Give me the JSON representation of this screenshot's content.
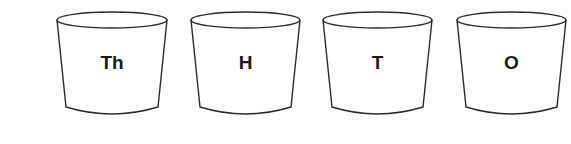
{
  "diagram": {
    "stroke_color": "#2a2a2a",
    "cups": [
      {
        "label": "Th",
        "meaning": "Thousands",
        "x_left": 57,
        "x_right": 167
      },
      {
        "label": "H",
        "meaning": "Hundreds",
        "x_left": 191,
        "x_right": 300
      },
      {
        "label": "T",
        "meaning": "Tens",
        "x_left": 323,
        "x_right": 432
      },
      {
        "label": "O",
        "meaning": "Ones",
        "x_left": 457,
        "x_right": 566
      }
    ]
  }
}
